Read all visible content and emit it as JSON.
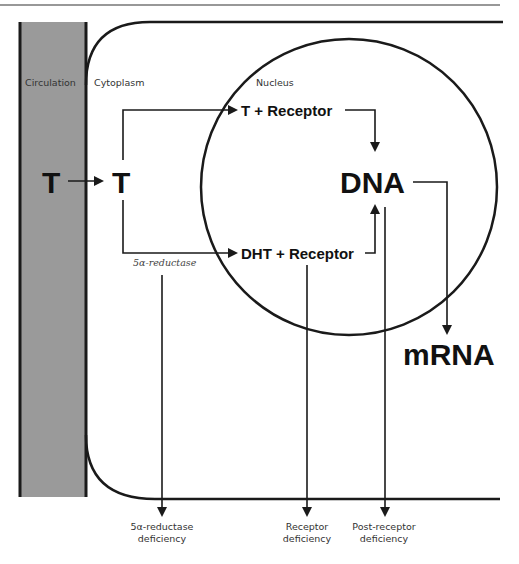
{
  "regions": {
    "circulation": "Circulation",
    "cytoplasm": "Cytoplasm",
    "nucleus": "Nucleus"
  },
  "nodes": {
    "t_circulation": "T",
    "t_cytoplasm": "T",
    "t_receptor": "T + Receptor",
    "dht_receptor": "DHT + Receptor",
    "dna": "DNA",
    "mrna": "mRNA"
  },
  "enzymes": {
    "five_alpha_reductase": "5α-reductase"
  },
  "deficiencies": [
    {
      "line1": "5α-reductase",
      "line2": "deficiency"
    },
    {
      "line1": "Receptor",
      "line2": "deficiency"
    },
    {
      "line1": "Post-receptor",
      "line2": "deficiency"
    }
  ],
  "colors": {
    "circulation_fill": "#9a9a9a",
    "stroke": "#1a1a1a"
  }
}
